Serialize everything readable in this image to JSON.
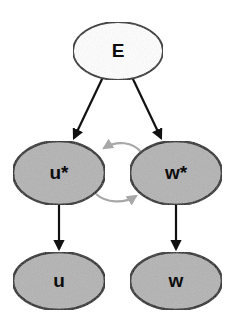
{
  "diagram": {
    "type": "node-link-diagram",
    "background_color": "#ffffff",
    "canvas": {
      "width": 235,
      "height": 331
    },
    "nodes": [
      {
        "id": "E",
        "label": "E",
        "cx": 118,
        "cy": 51,
        "rx": 45,
        "ry": 29,
        "fill": "#ffffff",
        "stroke": "#1a1a1a",
        "stroke_width": 1.8,
        "font_size": 19,
        "row": "top"
      },
      {
        "id": "u_star",
        "label": "u*",
        "cx": 59,
        "cy": 173,
        "rx": 46,
        "ry": 32,
        "fill": "#b3b3b3",
        "stroke": "#1a1a1a",
        "stroke_width": 2.4,
        "font_size": 19,
        "row": "middle"
      },
      {
        "id": "w_star",
        "label": "w*",
        "cx": 176,
        "cy": 173,
        "rx": 46,
        "ry": 32,
        "fill": "#b3b3b3",
        "stroke": "#1a1a1a",
        "stroke_width": 2.4,
        "font_size": 19,
        "row": "middle"
      },
      {
        "id": "u",
        "label": "u",
        "cx": 59,
        "cy": 281,
        "rx": 46,
        "ry": 29,
        "fill": "#b3b3b3",
        "stroke": "#1a1a1a",
        "stroke_width": 2.4,
        "font_size": 19,
        "row": "bottom"
      },
      {
        "id": "w",
        "label": "w",
        "cx": 176,
        "cy": 281,
        "rx": 46,
        "ry": 29,
        "fill": "#b3b3b3",
        "stroke": "#1a1a1a",
        "stroke_width": 2.4,
        "font_size": 19,
        "row": "bottom"
      }
    ],
    "edges": [
      {
        "id": "e-to-ustar",
        "from": "E",
        "to": "u_star",
        "style": "straight",
        "color": "#111111",
        "width": 2.2,
        "arrowhead": "end",
        "path": "M 103 77 L 74 138"
      },
      {
        "id": "e-to-wstar",
        "from": "E",
        "to": "w_star",
        "style": "straight",
        "color": "#111111",
        "width": 2.2,
        "arrowhead": "end",
        "path": "M 132 77 L 161 138"
      },
      {
        "id": "wstar-to-ustar",
        "from": "w_star",
        "to": "u_star",
        "style": "curved",
        "color": "#a8a8a8",
        "width": 2.2,
        "arrowhead": "end",
        "path": "M 141 152 C 133 142 117 140 104 148"
      },
      {
        "id": "ustar-to-wstar",
        "from": "u_star",
        "to": "w_star",
        "style": "curved",
        "color": "#a8a8a8",
        "width": 2.2,
        "arrowhead": "end",
        "path": "M 96 194 C 106 203 124 204 136 196"
      },
      {
        "id": "ustar-to-u",
        "from": "u_star",
        "to": "u",
        "style": "straight",
        "color": "#111111",
        "width": 2.2,
        "arrowhead": "end",
        "path": "M 59 205 L 59 249"
      },
      {
        "id": "wstar-to-w",
        "from": "w_star",
        "to": "w",
        "style": "straight",
        "color": "#111111",
        "width": 2.2,
        "arrowhead": "end",
        "path": "M 176 205 L 176 249"
      }
    ],
    "colors": {
      "node_fill_gray": "#b3b3b3",
      "node_fill_white": "#ffffff",
      "edge_black": "#111111",
      "edge_gray": "#a8a8a8",
      "stroke": "#1a1a1a"
    }
  }
}
